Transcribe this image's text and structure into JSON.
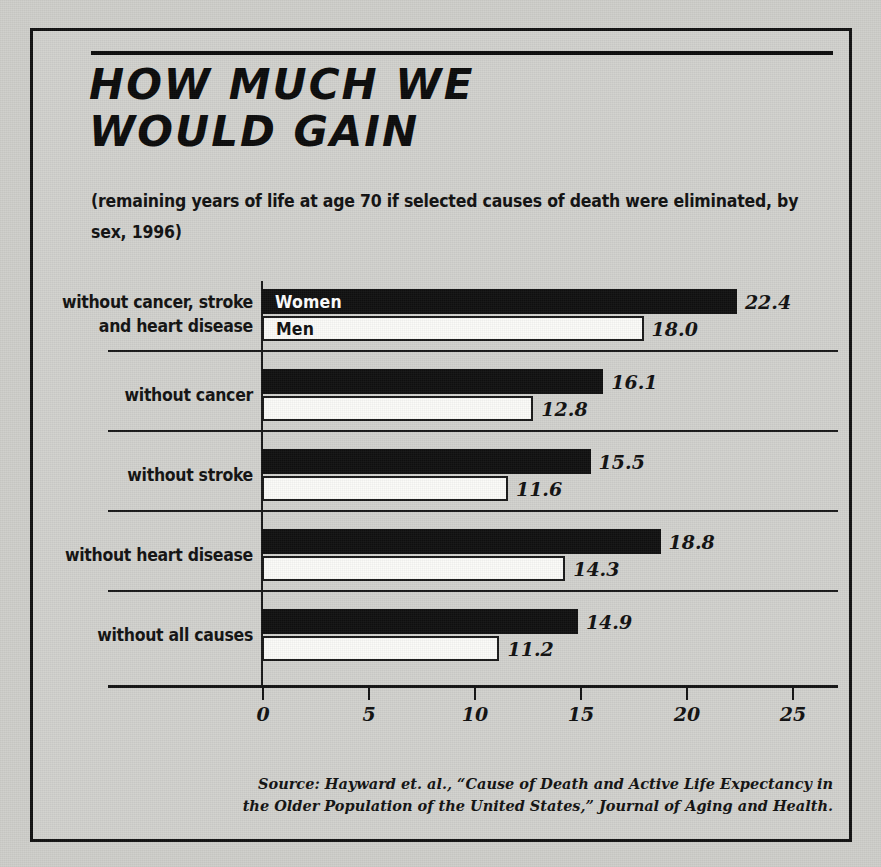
{
  "figure": {
    "title": "HOW MUCH WE\nWOULD GAIN",
    "subtitle": "(remaining years of life at age 70 if selected causes of death were eliminated, by sex, 1996)",
    "source": "Source:  Hayward et. al., “Cause of Death and Active Life Expectancy in the Older Population of the United States,” Journal of Aging and Health.",
    "ink_color": "#111111",
    "paper_color": "#d2d2ce"
  },
  "series_labels": {
    "women": "Women",
    "men": "Men"
  },
  "groups": [
    {
      "label": "without cancer, stroke\nand heart disease",
      "women": "22.4",
      "men": "18.0"
    },
    {
      "label": "without cancer",
      "women": "16.1",
      "men": "12.8"
    },
    {
      "label": "without stroke",
      "women": "15.5",
      "men": "11.6"
    },
    {
      "label": "without heart disease",
      "women": "18.8",
      "men": "14.3"
    },
    {
      "label": "without all causes",
      "women": "14.9",
      "men": "11.2"
    }
  ],
  "axis": {
    "ticks": [
      "0",
      "5",
      "10",
      "15",
      "20",
      "25"
    ]
  },
  "chart_data": {
    "type": "bar",
    "orientation": "horizontal",
    "title": "HOW MUCH WE WOULD GAIN",
    "subtitle": "(remaining years of life at age 70 if selected causes of death were eliminated, by sex, 1996)",
    "xlabel": "",
    "ylabel": "",
    "xlim": [
      0,
      25
    ],
    "xticks": [
      0,
      5,
      10,
      15,
      20,
      25
    ],
    "grid": false,
    "legend": "in-bar labels on first group",
    "categories": [
      "without cancer, stroke and heart disease",
      "without cancer",
      "without stroke",
      "without heart disease",
      "without all causes"
    ],
    "series": [
      {
        "name": "Women",
        "color": "#111111",
        "values": [
          22.4,
          16.1,
          15.5,
          18.8,
          14.9
        ]
      },
      {
        "name": "Men",
        "color": "#fbfbf8",
        "values": [
          18.0,
          12.8,
          11.6,
          14.3,
          11.2
        ]
      }
    ],
    "source": "Source: Hayward et. al., “Cause of Death and Active Life Expectancy in the Older Population of the United States,” Journal of Aging and Health."
  }
}
